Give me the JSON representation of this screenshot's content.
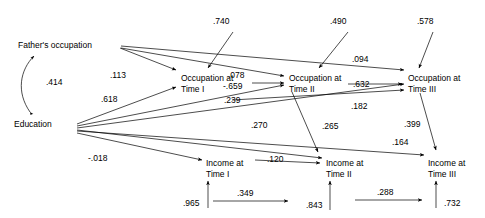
{
  "diagram": {
    "type": "path-diagram",
    "nodes": [
      {
        "id": "father",
        "label_line1": "Father's occupation",
        "label_line2": "",
        "x": 68,
        "y": 45
      },
      {
        "id": "educ",
        "label_line1": "Education",
        "label_line2": "",
        "x": 40,
        "y": 124
      },
      {
        "id": "occ1",
        "label_line1": "Occupation at",
        "label_line2": "Time I",
        "x": 190,
        "y": 78
      },
      {
        "id": "occ2",
        "label_line1": "Occupation at",
        "label_line2": "Time II",
        "x": 300,
        "y": 78
      },
      {
        "id": "occ3",
        "label_line1": "Occupation at",
        "label_line2": "Time III",
        "x": 420,
        "y": 78
      },
      {
        "id": "inc1",
        "label_line1": "Income at",
        "label_line2": "Time I",
        "x": 215,
        "y": 163
      },
      {
        "id": "inc2",
        "label_line1": "Income at",
        "label_line2": "Time II",
        "x": 335,
        "y": 163
      },
      {
        "id": "inc3",
        "label_line1": "Income at",
        "label_line2": "Time III",
        "x": 438,
        "y": 163
      }
    ],
    "coefficients": [
      {
        "id": "c-father-educ",
        "value": ".414",
        "from": "father",
        "to": "educ",
        "kind": "correlation",
        "x": 46,
        "y": 85
      },
      {
        "id": "c-father-occ1",
        "value": ".113",
        "from": "father",
        "to": "occ1",
        "kind": "path",
        "x": 113,
        "y": 77
      },
      {
        "id": "c-educ-occ1",
        "value": ".618",
        "from": "educ",
        "to": "occ1",
        "kind": "path",
        "x": 107,
        "y": 100
      },
      {
        "id": "c-father-occ2",
        "value": ".078",
        "from": "father",
        "to": "occ2",
        "kind": "path",
        "x": 239,
        "y": 76
      },
      {
        "id": "c-occ1-occ2",
        "value": "-.659",
        "from": "occ1",
        "to": "occ2",
        "kind": "path",
        "x": 233,
        "y": 88
      },
      {
        "id": "c-educ-occ2",
        "value": ".239",
        "from": "educ",
        "to": "occ2",
        "kind": "path",
        "x": 236,
        "y": 101
      },
      {
        "id": "c-father-occ3",
        "value": ".094",
        "from": "father",
        "to": "occ3",
        "kind": "path",
        "x": 360,
        "y": 60
      },
      {
        "id": "c-occ2-occ3",
        "value": ".632",
        "from": "occ2",
        "to": "occ3",
        "kind": "path",
        "x": 363,
        "y": 86
      },
      {
        "id": "c-occ1-occ3",
        "value": ".182",
        "from": "occ1",
        "to": "occ3",
        "kind": "path",
        "x": 358,
        "y": 107
      },
      {
        "id": "c-educ-inc1",
        "value": "-.018",
        "from": "educ",
        "to": "inc1",
        "kind": "path",
        "x": 100,
        "y": 158
      },
      {
        "id": "c-educ-inc2",
        "value": ".270",
        "from": "educ",
        "to": "inc2",
        "kind": "path",
        "x": 260,
        "y": 126
      },
      {
        "id": "c-inc1-inc2",
        "value": ".120",
        "from": "inc1",
        "to": "inc2",
        "kind": "path",
        "x": 276,
        "y": 160
      },
      {
        "id": "c-occ2-inc2",
        "value": ".265",
        "from": "occ2",
        "to": "inc2",
        "kind": "path",
        "x": 330,
        "y": 127
      },
      {
        "id": "c-educ-inc3",
        "value": ".164",
        "from": "educ",
        "to": "inc3",
        "kind": "path",
        "x": 400,
        "y": 143
      },
      {
        "id": "c-occ3-inc3",
        "value": ".399",
        "from": "occ3",
        "to": "inc3",
        "kind": "path",
        "x": 412,
        "y": 125
      },
      {
        "id": "r-occ1",
        "value": ".740",
        "from": "residual",
        "to": "occ1",
        "kind": "residual",
        "x": 213,
        "y": 20
      },
      {
        "id": "r-occ2",
        "value": ".490",
        "from": "residual",
        "to": "occ2",
        "kind": "residual",
        "x": 330,
        "y": 20
      },
      {
        "id": "r-occ3",
        "value": ".578",
        "from": "residual",
        "to": "occ3",
        "kind": "residual",
        "x": 417,
        "y": 20
      },
      {
        "id": "r-inc1",
        "value": ".965",
        "from": "residual",
        "to": "inc1",
        "kind": "residual",
        "x": 183,
        "y": 200
      },
      {
        "id": "r-inc2",
        "value": ".843",
        "from": "residual",
        "to": "inc2",
        "kind": "residual",
        "x": 308,
        "y": 202
      },
      {
        "id": "r-inc3",
        "value": ".732",
        "from": "residual",
        "to": "inc3",
        "kind": "residual",
        "x": 447,
        "y": 200
      },
      {
        "id": "c-inc1r-inc2r",
        "value": ".349",
        "from": "r-inc1",
        "to": "r-inc2",
        "kind": "residual-corr",
        "x": 246,
        "y": 194
      },
      {
        "id": "c-inc2r-inc3r",
        "value": ".288",
        "from": "r-inc2",
        "to": "r-inc3",
        "kind": "residual-corr",
        "x": 384,
        "y": 193
      }
    ]
  }
}
